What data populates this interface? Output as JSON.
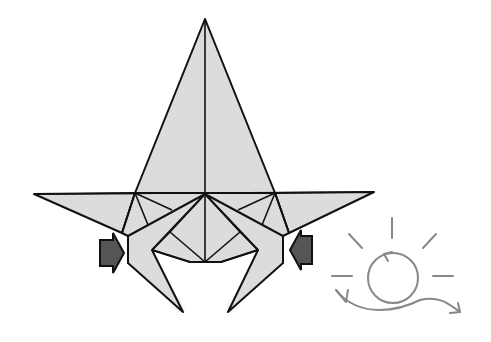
{
  "diagram": {
    "type": "origami-fold-step",
    "colors": {
      "paper": "#dcdcdc",
      "line": "#111111",
      "arrow_fill": "#555555",
      "symbol": "#888888",
      "background": "#ffffff"
    },
    "elements": [
      {
        "name": "origami-model",
        "description": "Folded paper with tall central point, two horizontal side flaps and two legs"
      },
      {
        "name": "push-arrow-left",
        "description": "Dark push/squash arrow pointing right"
      },
      {
        "name": "push-arrow-right",
        "description": "Dark push/squash arrow pointing left"
      },
      {
        "name": "turn-over-symbol",
        "description": "Circle with loop arrow and radiating lines"
      }
    ]
  }
}
